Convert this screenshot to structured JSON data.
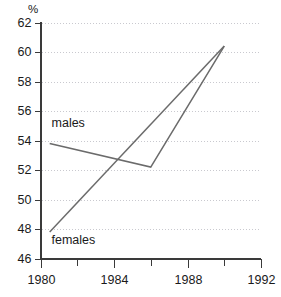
{
  "chart_data": {
    "type": "line",
    "title": "",
    "xlabel": "",
    "ylabel": "%",
    "xlim": [
      1980,
      1992
    ],
    "ylim": [
      46,
      62
    ],
    "grid": true,
    "legend_position": "inline-labels",
    "x_ticks": [
      1980,
      1982,
      1984,
      1986,
      1988,
      1990,
      1992
    ],
    "x_tick_labels": [
      "1980",
      "",
      "1984",
      "",
      "1988",
      "",
      "1992"
    ],
    "y_ticks": [
      46,
      48,
      50,
      52,
      54,
      56,
      58,
      60,
      62
    ],
    "y_tick_labels": [
      "46",
      "48",
      "50",
      "52",
      "54",
      "56",
      "58",
      "60",
      "62"
    ],
    "series": [
      {
        "name": "males",
        "color": "#6b6b6b",
        "x": [
          1980.5,
          1986.0,
          1990.0
        ],
        "values": [
          53.8,
          52.2,
          60.4
        ]
      },
      {
        "name": "females",
        "color": "#6b6b6b",
        "x": [
          1980.5,
          1990.0
        ],
        "values": [
          47.8,
          60.4
        ]
      }
    ],
    "annotations": [
      {
        "text": "males",
        "x": 1980.6,
        "y": 54.9
      },
      {
        "text": "females",
        "x": 1980.6,
        "y": 47.0
      }
    ]
  },
  "axes": {
    "y_unit_label": "%"
  }
}
